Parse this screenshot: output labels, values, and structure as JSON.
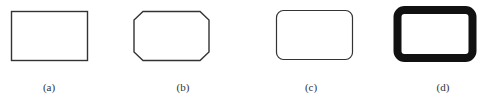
{
  "figure": {
    "stroke_color": "#333333",
    "fill_color": "#ffffff",
    "panels": [
      {
        "id": "a",
        "label": "(a)",
        "shape": "rectangle",
        "corner_style": "square"
      },
      {
        "id": "b",
        "label": "(b)",
        "shape": "rectangle",
        "corner_style": "chamfered"
      },
      {
        "id": "c",
        "label": "(c)",
        "shape": "rectangle",
        "corner_style": "rounded"
      },
      {
        "id": "d",
        "label": "(d)",
        "shape": "rectangle",
        "corner_style": "rounded-thick-border"
      }
    ]
  }
}
